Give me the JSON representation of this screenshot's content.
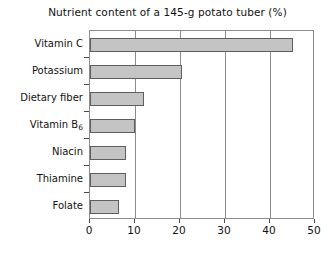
{
  "chart_data": {
    "type": "bar",
    "orientation": "horizontal",
    "title": "Nutrient content of a 145-g potato tuber (%)",
    "xlabel": "",
    "ylabel": "",
    "categories": [
      "Vitamin C",
      "Potassium",
      "Dietary fiber",
      "Vitamin B6",
      "Niacin",
      "Thiamine",
      "Folate"
    ],
    "category_labels_html": [
      "Vitamin C",
      "Potassium",
      "Dietary fiber",
      "Vitamin B<sub>6</sub>",
      "Niacin",
      "Thiamine",
      "Folate"
    ],
    "values": [
      45,
      20.5,
      12,
      10,
      8,
      8,
      6.5
    ],
    "xlim": [
      0,
      50
    ],
    "xticks": [
      0,
      10,
      20,
      30,
      40,
      50
    ],
    "xtick_labels": [
      "0",
      "10",
      "20",
      "30",
      "40",
      "50"
    ],
    "grid": "vertical",
    "legend": "none",
    "bar_color": "#c4c4c4",
    "bar_border_color": "#5e5e5e",
    "axis_color": "#8c8c8c",
    "text_color": "#111111",
    "background": "#ffffff"
  }
}
